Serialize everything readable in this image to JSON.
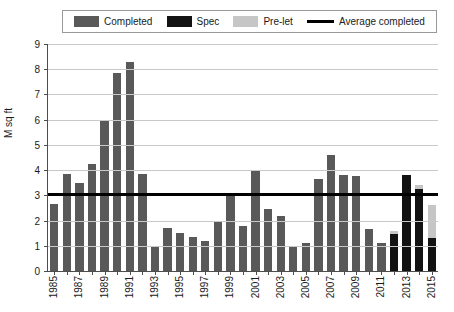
{
  "legend": {
    "items": [
      {
        "label": "Completed",
        "type": "swatch",
        "color": "#595959",
        "name": "legend-completed"
      },
      {
        "label": "Spec",
        "type": "swatch",
        "color": "#121212",
        "name": "legend-spec"
      },
      {
        "label": "Pre-let",
        "type": "swatch",
        "color": "#c6c6c6",
        "name": "legend-prelet"
      },
      {
        "label": "Average completed",
        "type": "line",
        "color": "#000000",
        "name": "legend-average-completed"
      }
    ]
  },
  "axes": {
    "ylabel": "M sq ft",
    "yticks": [
      "0",
      "1",
      "2",
      "3",
      "4",
      "5",
      "6",
      "7",
      "8",
      "9"
    ],
    "ymin": 0,
    "ymax": 9,
    "xlabels_shown": [
      "1985",
      "1987",
      "1989",
      "1991",
      "1993",
      "1995",
      "1997",
      "1999",
      "2001",
      "2003",
      "2005",
      "2007",
      "2009",
      "2011",
      "2013",
      "2015"
    ]
  },
  "chart_data": {
    "type": "bar",
    "title": "",
    "xlabel": "",
    "ylabel": "M sq ft",
    "ylim": [
      0,
      9
    ],
    "grid": true,
    "legend_position": "top",
    "stacked": true,
    "categories": [
      "1985",
      "1986",
      "1987",
      "1988",
      "1989",
      "1990",
      "1991",
      "1992",
      "1993",
      "1994",
      "1995",
      "1996",
      "1997",
      "1998",
      "1999",
      "2000",
      "2001",
      "2002",
      "2003",
      "2004",
      "2005",
      "2006",
      "2007",
      "2008",
      "2009",
      "2010",
      "2011",
      "2012",
      "2013",
      "2014",
      "2015"
    ],
    "series": [
      {
        "name": "Completed",
        "color": "#595959",
        "values": [
          2.65,
          3.85,
          3.5,
          4.25,
          6.0,
          7.85,
          8.3,
          3.85,
          1.0,
          1.7,
          1.5,
          1.35,
          1.2,
          1.95,
          3.0,
          1.8,
          3.95,
          2.45,
          2.2,
          0.95,
          1.1,
          3.65,
          4.6,
          3.8,
          3.75,
          1.65,
          1.1,
          0.0,
          0.0,
          0.0,
          0.0
        ]
      },
      {
        "name": "Spec",
        "color": "#121212",
        "values": [
          0,
          0,
          0,
          0,
          0,
          0,
          0,
          0,
          0,
          0,
          0,
          0,
          0,
          0,
          0,
          0,
          0,
          0,
          0,
          0,
          0,
          0,
          0,
          0,
          0,
          0,
          0,
          1.45,
          3.8,
          3.25,
          1.3
        ]
      },
      {
        "name": "Pre-let",
        "color": "#c6c6c6",
        "values": [
          0,
          0,
          0,
          0,
          0,
          0,
          0,
          0,
          0,
          0,
          0,
          0,
          0,
          0,
          0,
          0,
          0,
          0,
          0,
          0,
          0,
          0,
          0,
          0,
          0,
          0,
          0,
          0.15,
          0.0,
          0.15,
          1.3
        ]
      }
    ],
    "annotations": [
      {
        "name": "average-completed-line",
        "type": "hline",
        "value": 3.05,
        "label": "Average completed",
        "color": "#000000"
      }
    ]
  }
}
